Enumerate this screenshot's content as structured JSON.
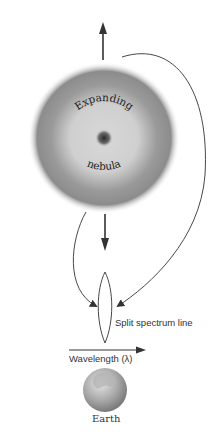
{
  "diagram": {
    "nebula": {
      "label_top": "Expanding",
      "label_bottom": "nebula"
    },
    "spectrum": {
      "label": "Split spectrum line"
    },
    "axis": {
      "label": "Wavelength (λ)"
    },
    "observer": {
      "label": "Earth"
    },
    "colors": {
      "nebula_outer": "#8a8a8a",
      "nebula_inner": "#d4d4d4",
      "nebula_core": "#3a3a3a",
      "line": "#333333",
      "earth": "#a8a8a8"
    }
  }
}
